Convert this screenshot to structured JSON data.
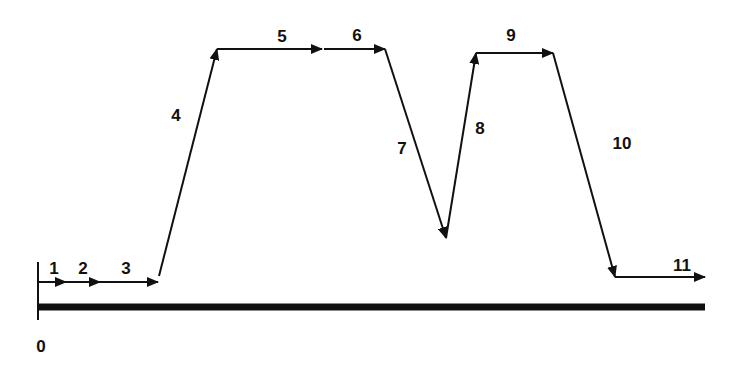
{
  "diagram": {
    "type": "stepwise-profile",
    "origin_label": "0",
    "line_color": "#111111",
    "background": "#ffffff",
    "baseline": {
      "x1": 38,
      "x2": 705,
      "y": 307,
      "thickness": 7
    },
    "origin_tick": {
      "x": 38,
      "y1": 262,
      "y2": 320
    },
    "segments": [
      {
        "id": "1",
        "label": "1",
        "from": [
          38,
          282
        ],
        "to": [
          66,
          282
        ],
        "label_pos": [
          54,
          268
        ]
      },
      {
        "id": "2",
        "label": "2",
        "from": [
          66,
          282
        ],
        "to": [
          100,
          282
        ],
        "label_pos": [
          83,
          268
        ]
      },
      {
        "id": "3",
        "label": "3",
        "from": [
          100,
          282
        ],
        "to": [
          158,
          282
        ],
        "label_pos": [
          126,
          268
        ]
      },
      {
        "id": "4",
        "label": "4",
        "from": [
          159,
          276
        ],
        "to": [
          217,
          49
        ],
        "label_pos": [
          176,
          115
        ]
      },
      {
        "id": "5",
        "label": "5",
        "from": [
          217,
          49
        ],
        "to": [
          322,
          49
        ],
        "label_pos": [
          282,
          36
        ]
      },
      {
        "id": "6",
        "label": "6",
        "from": [
          324,
          49
        ],
        "to": [
          385,
          49
        ],
        "label_pos": [
          357,
          35
        ]
      },
      {
        "id": "7",
        "label": "7",
        "from": [
          385,
          49
        ],
        "to": [
          446,
          238
        ],
        "label_pos": [
          402,
          148
        ]
      },
      {
        "id": "8",
        "label": "8",
        "from": [
          446,
          238
        ],
        "to": [
          476,
          53
        ],
        "label_pos": [
          480,
          128
        ]
      },
      {
        "id": "9",
        "label": "9",
        "from": [
          476,
          53
        ],
        "to": [
          553,
          53
        ],
        "label_pos": [
          511,
          35
        ]
      },
      {
        "id": "10",
        "label": "10",
        "from": [
          553,
          53
        ],
        "to": [
          615,
          277
        ],
        "label_pos": [
          622,
          143
        ]
      },
      {
        "id": "11",
        "label": "11",
        "from": [
          615,
          277
        ],
        "to": [
          705,
          277
        ],
        "label_pos": [
          682,
          265
        ]
      }
    ],
    "origin_label_pos": [
      41,
      346
    ]
  }
}
